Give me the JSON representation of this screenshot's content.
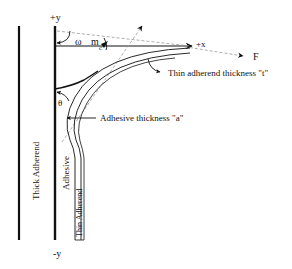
{
  "diagram": {
    "axes": {
      "plus_y": "+y",
      "minus_y": "-y",
      "plus_x": "+x"
    },
    "symbols": {
      "omega": "ω",
      "m": "m",
      "m_sub": "c",
      "theta": "θ",
      "force": "F"
    },
    "labels": {
      "thin_adherend_thickness": "Thin adherend thickness \"t\"",
      "adhesive_thickness": "Adhesive thickness \"a\"",
      "thick_adherend": "Thick Adherend",
      "adhesive": "Adhesive",
      "thin_adherend": "Thin Adherend"
    },
    "colors": {
      "line": "#111111",
      "dashed": "#999999",
      "background": "#ffffff"
    }
  }
}
